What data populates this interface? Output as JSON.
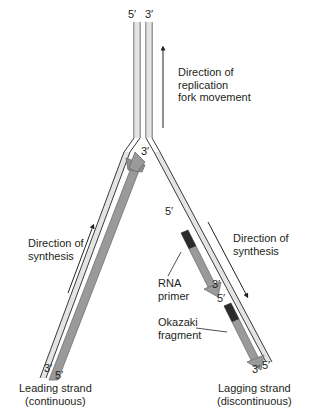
{
  "diagram": {
    "type": "DNA replication fork",
    "colors": {
      "strand_fill": "#e4e4e4",
      "strand_outline": "#3a3a3a",
      "new_strand_fill": "#9a9a9a",
      "new_strand_edge": "#6e6e6e",
      "rna_primer": "#2b2b2b",
      "text": "#231f20"
    },
    "top_labels": {
      "left_end": "5′",
      "right_end": "3′"
    },
    "fork_movement": {
      "line1": "Direction of",
      "line2": "replication",
      "line3": "fork movement"
    },
    "leading": {
      "synthesis_line1": "Direction of",
      "synthesis_line2": "synthesis",
      "new_strand_tip": "3′",
      "bottom_left": "3′",
      "bottom_right": "5′",
      "name_line1": "Leading strand",
      "name_line2": "(continuous)"
    },
    "lagging": {
      "synthesis_line1": "Direction of",
      "synthesis_line2": "synthesis",
      "fragment1_start": "5′",
      "fragment1_end": "3′",
      "fragment2_start": "5′",
      "bottom_left": "3′",
      "bottom_right": "5′",
      "rna_primer_line1": "RNA",
      "rna_primer_line2": "primer",
      "okazaki_line1": "Okazaki",
      "okazaki_line2": "fragment",
      "name_line1": "Lagging strand",
      "name_line2": "(discontinuous)"
    }
  }
}
